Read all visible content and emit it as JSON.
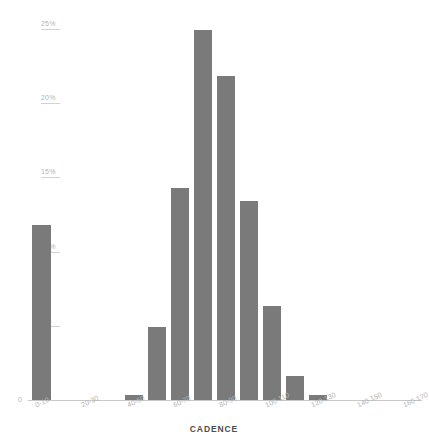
{
  "chart_data": {
    "type": "bar",
    "title": "",
    "xlabel": "CADENCE",
    "ylabel": "",
    "categories": [
      "0-10",
      "10-20",
      "20-30",
      "30-40",
      "40-50",
      "50-60",
      "60-70",
      "70-80",
      "80-90",
      "90-100",
      "100-110",
      "110-120",
      "120-130",
      "130-140",
      "140-150",
      "150-160",
      "160-170"
    ],
    "values": [
      11.8,
      0.0,
      0.0,
      0.0,
      0.35,
      4.9,
      14.3,
      24.9,
      21.8,
      13.4,
      6.3,
      1.6,
      0.35,
      0.0,
      0.0,
      0.0,
      0.0
    ],
    "visible_xtick_labels": [
      "0-10",
      "20-30",
      "40-50",
      "60-70",
      "80-90",
      "100-110",
      "120-130",
      "140-150",
      "160-170"
    ],
    "ytick_labels": [
      "5%",
      "10%",
      "15%",
      "20%",
      "25%"
    ],
    "ytick_values": [
      5,
      10,
      15,
      20,
      25
    ],
    "ylim": [
      0,
      26
    ],
    "zero_label": "0",
    "grid": true,
    "legend": "none",
    "bar_color": "#7a7a7a",
    "gridline_color": "#d2d2d2",
    "axis_text_color": "#b4b4b4",
    "title_color": "#4d4d4d",
    "background_color": "#ffffff"
  }
}
